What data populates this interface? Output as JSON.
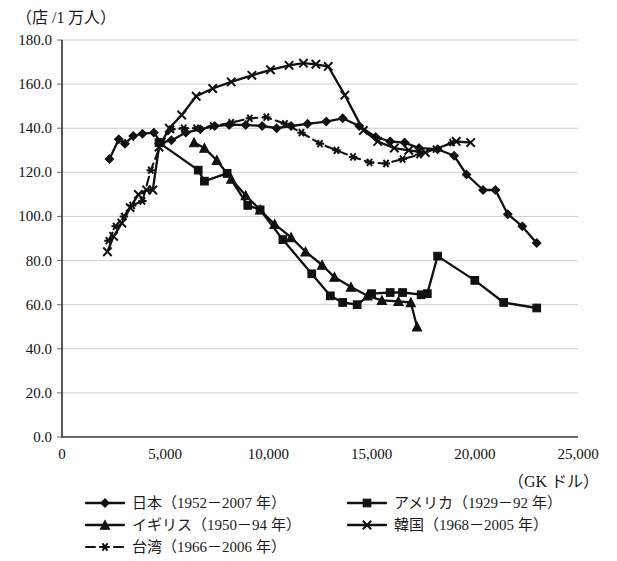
{
  "chart_data": {
    "type": "line",
    "title": "",
    "ylabel": "（店 /1 万人）",
    "xlabel": "（GK ドル）",
    "xlim": [
      0,
      25000
    ],
    "ylim": [
      0,
      180
    ],
    "xticks": [
      0,
      5000,
      10000,
      15000,
      20000,
      25000
    ],
    "xtick_labels": [
      "0",
      "5,000",
      "10,000",
      "15,000",
      "20,000",
      "25,000"
    ],
    "yticks": [
      0,
      20,
      40,
      60,
      80,
      100,
      120,
      140,
      160,
      180
    ],
    "ytick_labels": [
      "0.0",
      "20.0",
      "40.0",
      "60.0",
      "80.0",
      "100.0",
      "120.0",
      "140.0",
      "160.0",
      "180.0"
    ],
    "grid": "horizontal",
    "legend_position": "bottom-left",
    "series": [
      {
        "name": "日本（1952－2007 年）",
        "marker": "diamond",
        "linestyle": "solid",
        "color": "#111111",
        "points": [
          [
            2300,
            126.0
          ],
          [
            2750,
            135.0
          ],
          [
            3050,
            133.0
          ],
          [
            3450,
            136.5
          ],
          [
            3900,
            137.5
          ],
          [
            4450,
            138.0
          ],
          [
            4800,
            133.5
          ],
          [
            5300,
            134.5
          ],
          [
            6000,
            138.0
          ],
          [
            6700,
            139.5
          ],
          [
            7400,
            141.0
          ],
          [
            8100,
            141.5
          ],
          [
            8900,
            141.5
          ],
          [
            9700,
            141.0
          ],
          [
            10400,
            140.0
          ],
          [
            11100,
            141.0
          ],
          [
            11900,
            142.0
          ],
          [
            12800,
            143.0
          ],
          [
            13600,
            144.5
          ],
          [
            14400,
            141.0
          ],
          [
            15200,
            136.0
          ],
          [
            15900,
            134.0
          ],
          [
            16600,
            133.5
          ],
          [
            17300,
            131.0
          ],
          [
            18200,
            130.5
          ],
          [
            19000,
            127.5
          ],
          [
            19600,
            119.0
          ],
          [
            20400,
            112.0
          ],
          [
            21000,
            112.0
          ],
          [
            21600,
            101.0
          ],
          [
            22300,
            95.5
          ],
          [
            23000,
            88.0
          ]
        ]
      },
      {
        "name": "アメリカ（1929－92 年）",
        "marker": "square",
        "linestyle": "solid",
        "color": "#111111",
        "points": [
          [
            4700,
            133.5
          ],
          [
            6600,
            121.0
          ],
          [
            6900,
            116.0
          ],
          [
            8000,
            119.5
          ],
          [
            9000,
            105.0
          ],
          [
            9600,
            103.0
          ],
          [
            10700,
            89.5
          ],
          [
            12100,
            74.0
          ],
          [
            13000,
            64.0
          ],
          [
            13600,
            61.0
          ],
          [
            14300,
            60.0
          ],
          [
            15000,
            65.0
          ],
          [
            15900,
            65.5
          ],
          [
            16500,
            65.5
          ],
          [
            17400,
            64.5
          ],
          [
            17700,
            65.0
          ],
          [
            18200,
            82.0
          ],
          [
            20000,
            71.0
          ],
          [
            21400,
            61.0
          ],
          [
            23000,
            58.5
          ]
        ]
      },
      {
        "name": "イギリス（1950－94 年）",
        "marker": "triangle",
        "linestyle": "solid",
        "color": "#111111",
        "points": [
          [
            6400,
            133.5
          ],
          [
            6900,
            131.0
          ],
          [
            7500,
            125.5
          ],
          [
            8200,
            117.0
          ],
          [
            8900,
            109.5
          ],
          [
            9600,
            103.0
          ],
          [
            10300,
            96.5
          ],
          [
            11100,
            90.5
          ],
          [
            11800,
            84.0
          ],
          [
            12600,
            78.0
          ],
          [
            13200,
            72.5
          ],
          [
            14000,
            68.0
          ],
          [
            14800,
            64.0
          ],
          [
            15500,
            62.0
          ],
          [
            16300,
            61.5
          ],
          [
            16900,
            61.0
          ],
          [
            17200,
            50.0
          ]
        ]
      },
      {
        "name": "韓国（1968－2005 年）",
        "marker": "x",
        "linestyle": "solid",
        "color": "#111111",
        "points": [
          [
            2200,
            84.0
          ],
          [
            2500,
            91.0
          ],
          [
            2900,
            97.0
          ],
          [
            3300,
            104.0
          ],
          [
            3700,
            110.0
          ],
          [
            4100,
            112.0
          ],
          [
            4400,
            112.0
          ],
          [
            4700,
            131.5
          ],
          [
            5200,
            140.0
          ],
          [
            5800,
            146.0
          ],
          [
            6500,
            154.5
          ],
          [
            7300,
            158.0
          ],
          [
            8200,
            161.0
          ],
          [
            9200,
            164.0
          ],
          [
            10100,
            166.5
          ],
          [
            11000,
            168.5
          ],
          [
            11700,
            169.5
          ],
          [
            12300,
            169.0
          ],
          [
            12900,
            168.0
          ],
          [
            13700,
            155.0
          ],
          [
            14600,
            139.0
          ],
          [
            15300,
            134.0
          ],
          [
            16100,
            131.0
          ],
          [
            16800,
            130.0
          ],
          [
            17600,
            129.0
          ],
          [
            19100,
            134.0
          ],
          [
            19800,
            133.5
          ]
        ]
      },
      {
        "name": "台湾（1966－2006 年）",
        "marker": "asterisk",
        "linestyle": "dashed",
        "color": "#111111",
        "points": [
          [
            2250,
            89.0
          ],
          [
            2600,
            95.5
          ],
          [
            3000,
            100.0
          ],
          [
            3400,
            105.0
          ],
          [
            3900,
            107.0
          ],
          [
            4300,
            121.0
          ],
          [
            4800,
            133.0
          ],
          [
            5300,
            139.5
          ],
          [
            5900,
            140.0
          ],
          [
            6500,
            140.0
          ],
          [
            7300,
            141.0
          ],
          [
            8200,
            142.5
          ],
          [
            9100,
            144.5
          ],
          [
            9900,
            145.0
          ],
          [
            10800,
            142.0
          ],
          [
            11600,
            138.0
          ],
          [
            12500,
            133.0
          ],
          [
            13300,
            130.0
          ],
          [
            14100,
            127.0
          ],
          [
            14900,
            124.5
          ],
          [
            15700,
            124.0
          ],
          [
            16500,
            126.0
          ],
          [
            17300,
            128.0
          ],
          [
            18100,
            130.5
          ],
          [
            18900,
            133.5
          ]
        ]
      }
    ]
  },
  "legend": {
    "items": [
      {
        "label": "日本（1952－2007 年）",
        "marker": "diamond",
        "linestyle": "solid"
      },
      {
        "label": "アメリカ（1929－92 年）",
        "marker": "square",
        "linestyle": "solid"
      },
      {
        "label": "イギリス（1950－94 年）",
        "marker": "triangle",
        "linestyle": "solid"
      },
      {
        "label": "韓国（1968－2005 年）",
        "marker": "x",
        "linestyle": "solid"
      },
      {
        "label": "台湾（1966－2006 年）",
        "marker": "asterisk",
        "linestyle": "dashed"
      }
    ]
  }
}
